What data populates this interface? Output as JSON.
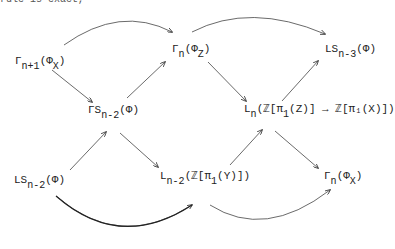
{
  "cutoff_text": "rule is exact, ",
  "nodes": [
    {
      "id": "gamma_n1_phiX",
      "base": "Γ",
      "sub": "n+1",
      "arg": "(Φ",
      "argsub": "X",
      "tail": ")"
    },
    {
      "id": "gamma_n_phiZ",
      "base": "Γ",
      "sub": "n",
      "arg": "(Φ",
      "argsub": "Z",
      "tail": ")"
    },
    {
      "id": "LS_n3",
      "base": "LS",
      "sub": "n-3",
      "arg": "(Φ)",
      "argsub": "",
      "tail": ""
    },
    {
      "id": "GS_n2",
      "base": "ΓS",
      "sub": "n-2",
      "arg": "(Φ)",
      "argsub": "",
      "tail": ""
    },
    {
      "id": "L_n_Z",
      "base": "L",
      "sub": "n",
      "arg": "(ℤ[π",
      "argsub": "1",
      "tail": "(Z)] → ℤ[π₁(X)])"
    },
    {
      "id": "LS_n2",
      "base": "LS",
      "sub": "n-2",
      "arg": "(Φ)",
      "argsub": "",
      "tail": ""
    },
    {
      "id": "L_n2_Y",
      "base": "L",
      "sub": "n-2",
      "arg": "(ℤ[π",
      "argsub": "1",
      "tail": "(Y)])"
    },
    {
      "id": "gamma_n_phiX",
      "base": "Γ",
      "sub": "n",
      "arg": "(Φ",
      "argsub": "X",
      "tail": ")"
    }
  ],
  "arrows": [
    {
      "from": "Γn+1(ΦX)",
      "to": "Γn(ΦZ)",
      "style": "curved-up"
    },
    {
      "from": "Γn+1(ΦX)",
      "to": "ΓSn-2(Φ)"
    },
    {
      "from": "ΓSn-2(Φ)",
      "to": "Γn(ΦZ)"
    },
    {
      "from": "Γn(ΦZ)",
      "to": "LSn-3(Φ)",
      "style": "curved-up"
    },
    {
      "from": "Γn(ΦZ)",
      "to": "Ln(ℤ[π1(Z)] → ℤ[π1(X)])"
    },
    {
      "from": "Ln(ℤ[π1(Z)] → ℤ[π1(X)])",
      "to": "LSn-3(Φ)"
    },
    {
      "from": "LSn-2(Φ)",
      "to": "ΓSn-2(Φ)"
    },
    {
      "from": "ΓSn-2(Φ)",
      "to": "Ln-2(ℤ[π1(Y)])"
    },
    {
      "from": "Ln-2(ℤ[π1(Y)])",
      "to": "Ln(ℤ[π1(Z)] → ℤ[π1(X)])"
    },
    {
      "from": "Ln(ℤ[π1(Z)] → ℤ[π1(X)])",
      "to": "Γn(ΦX)"
    },
    {
      "from": "LSn-2(Φ)",
      "to": "Ln-2(ℤ[π1(Y)])",
      "style": "curved-down"
    },
    {
      "from": "Ln-2(ℤ[π1(Y)])",
      "to": "Γn(ΦX)",
      "style": "curved-down"
    }
  ]
}
